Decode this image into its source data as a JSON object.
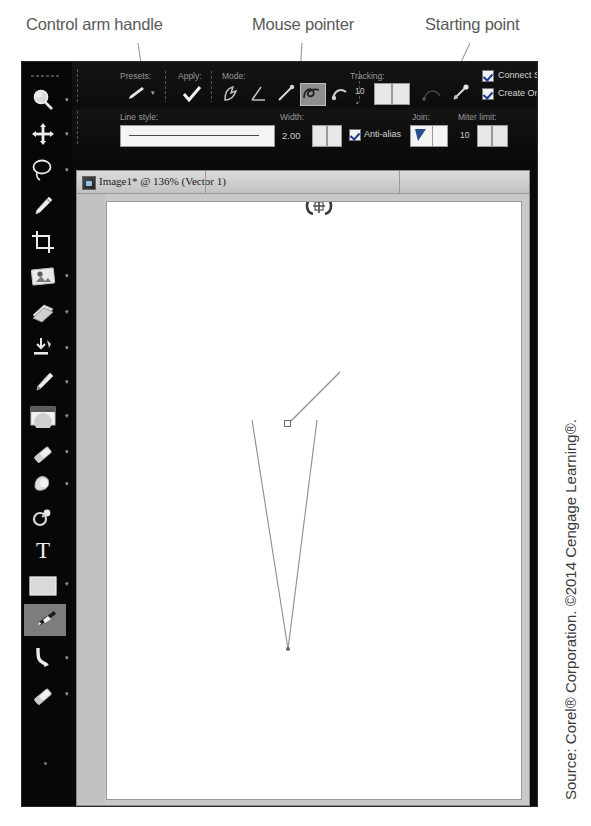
{
  "annotations": {
    "control_arm": "Control arm handle",
    "mouse_pointer": "Mouse pointer",
    "starting_point": "Starting point"
  },
  "attribution": "Source: Corel® Corporation. ©2014 Cengage Learning®.",
  "options_bar": {
    "presets_label": "Presets:",
    "apply_label": "Apply:",
    "mode_label": "Mode:",
    "tracking_label": "Tracking:",
    "tracking_value": "10",
    "line_style_label": "Line style:",
    "width_label": "Width:",
    "width_value": "2.00",
    "anti_alias_label": "Anti-alias",
    "join_label": "Join:",
    "miter_label": "Miter limit:",
    "miter_value": "10",
    "connect_segments_label": "Connect Segmen",
    "create_on_vector_label": "Create On Vect",
    "mode_buttons": [
      "mode-knife-icon",
      "mode-angle-icon",
      "mode-line-icon",
      "mode-freehand-icon",
      "mode-edit-icon"
    ],
    "selected_mode_index": 3
  },
  "document": {
    "title": "Image1* @ 136% (Vector 1)",
    "zoom": "136%",
    "layer": "Vector 1"
  },
  "tool_palette": {
    "items": [
      {
        "icon": "zoom-magnifier-icon",
        "has_arrow": true
      },
      {
        "icon": "pan-move-icon",
        "has_arrow": true
      },
      {
        "icon": "lasso-select-icon",
        "has_arrow": true
      },
      {
        "icon": "dropper-icon",
        "has_arrow": false
      },
      {
        "icon": "crop-icon",
        "has_arrow": false
      },
      {
        "icon": "straighten-image-icon",
        "has_arrow": true
      },
      {
        "icon": "clone-brush-icon",
        "has_arrow": true
      },
      {
        "icon": "fill-flood-icon",
        "has_arrow": true
      },
      {
        "icon": "paint-brush-icon",
        "has_arrow": true
      },
      {
        "icon": "lighten-darken-icon",
        "has_arrow": true
      },
      {
        "icon": "eraser-icon",
        "has_arrow": true
      },
      {
        "icon": "smudge-retouch-icon",
        "has_arrow": true
      },
      {
        "icon": "clone-stamp-icon",
        "has_arrow": false
      },
      {
        "icon": "text-tool-icon",
        "has_arrow": false
      },
      {
        "icon": "shape-rectangle-icon",
        "has_arrow": true
      },
      {
        "icon": "pen-tool-icon",
        "has_arrow": false
      },
      {
        "icon": "warp-brush-icon",
        "has_arrow": true
      },
      {
        "icon": "eraser-alt-icon",
        "has_arrow": true
      }
    ],
    "active_index": 15
  },
  "vector_path": {
    "start_node": {
      "x": 264,
      "y": 477
    },
    "end_node": {
      "x": 235,
      "y": 702
    },
    "control_arm_end": {
      "x": 228,
      "y": 701
    },
    "stroke_color": "#8d8d8d"
  },
  "colors": {
    "window_bg": "#0a0a0a",
    "palette_bg": "#070707",
    "doc_chrome": "#c9c9c9",
    "canvas": "#ffffff",
    "selected_tool": "#7d7d7d",
    "callout_text": "#5a5a5a",
    "leader_line": "#9a9a9a"
  }
}
